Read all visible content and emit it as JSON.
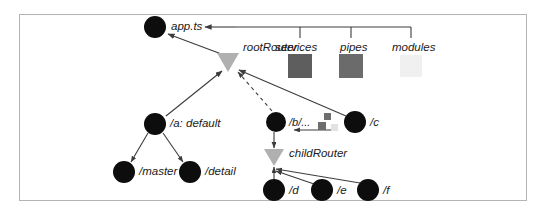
{
  "diagram": {
    "background_color": "#ffffff",
    "border_color": "#b4b4b4",
    "node_color": "#0d0d0d",
    "router_color": "#b0b0b0",
    "edge_color": "#3c3c3c",
    "nodes": [
      {
        "id": "app",
        "label": "app.ts",
        "cx": 155,
        "cy": 27,
        "r": 11,
        "label_x": 171,
        "label_y": 21,
        "font_size": 11.5
      },
      {
        "id": "a",
        "label": "/a: default",
        "cx": 155,
        "cy": 124,
        "r": 11,
        "label_x": 170,
        "label_y": 118,
        "font_size": 11.5
      },
      {
        "id": "master",
        "label": "/master",
        "cx": 124,
        "cy": 172,
        "r": 11,
        "label_x": 139,
        "label_y": 166,
        "font_size": 11.5
      },
      {
        "id": "detail",
        "label": "/detail",
        "cx": 190,
        "cy": 172,
        "r": 11,
        "label_x": 205,
        "label_y": 166,
        "font_size": 11.5
      },
      {
        "id": "b",
        "label": "/b/...",
        "cx": 276,
        "cy": 122,
        "r": 10,
        "label_x": 289,
        "label_y": 117,
        "font_size": 11
      },
      {
        "id": "c",
        "label": "/c",
        "cx": 355,
        "cy": 122,
        "r": 11,
        "label_x": 370,
        "label_y": 117,
        "font_size": 11.5
      },
      {
        "id": "d",
        "label": "/d",
        "cx": 274,
        "cy": 190,
        "r": 11,
        "label_x": 289,
        "label_y": 185,
        "font_size": 11.5
      },
      {
        "id": "e",
        "label": "/e",
        "cx": 322,
        "cy": 190,
        "r": 11,
        "label_x": 337,
        "label_y": 185,
        "font_size": 11.5
      },
      {
        "id": "f",
        "label": "/f",
        "cx": 368,
        "cy": 190,
        "r": 11,
        "label_x": 383,
        "label_y": 185,
        "font_size": 11.5
      }
    ],
    "routers": [
      {
        "id": "rootRouter",
        "label": "rootRouter",
        "cx": 228,
        "cy": 62,
        "half_width": 11,
        "height": 19,
        "label_x": 243,
        "label_y": 42,
        "font_size": 11.5
      },
      {
        "id": "childRouter",
        "label": "childRouter",
        "cx": 274,
        "cy": 157,
        "half_width": 10,
        "height": 17,
        "label_x": 289,
        "label_y": 148,
        "font_size": 11.5
      }
    ],
    "boxes": [
      {
        "id": "services",
        "label": "services",
        "x": 288,
        "y": 54,
        "size": 24,
        "color": "#5e5e5e",
        "label_x": 275,
        "label_y": 42,
        "font_size": 11.5,
        "tick_x": 300
      },
      {
        "id": "pipes",
        "label": "pipes",
        "x": 339,
        "y": 54,
        "size": 24,
        "color": "#6b6b6b",
        "label_x": 340,
        "label_y": 42,
        "font_size": 11.5,
        "tick_x": 351
      },
      {
        "id": "modules",
        "label": "modules",
        "x": 400,
        "y": 55,
        "size": 22,
        "color": "#f0f0f0",
        "label_x": 392,
        "label_y": 42,
        "font_size": 11.5,
        "tick_x": 411
      }
    ],
    "small_squares": [
      {
        "id": "square-top",
        "x": 324,
        "y": 113,
        "size": 7,
        "color": "#6e6e6e"
      },
      {
        "id": "square-bottom",
        "x": 318,
        "y": 122,
        "size": 8,
        "color": "#6e6e6e"
      },
      {
        "id": "square-faded",
        "x": 331,
        "y": 124,
        "size": 7,
        "color": "#e2e2e2"
      }
    ],
    "bracket": {
      "y": 27,
      "x_start": 236,
      "x_end": 411,
      "tick_height": 11
    }
  }
}
